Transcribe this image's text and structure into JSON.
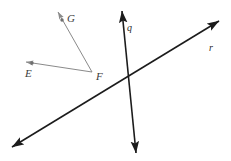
{
  "figure": {
    "type": "geometry-diagram",
    "width": 231,
    "height": 161,
    "background_color": "#ffffff",
    "points": [
      {
        "id": "E",
        "label": "E",
        "x": 32,
        "y": 63,
        "label_x": 25,
        "label_y": 68,
        "marker": "dot",
        "marker_color": "#6f6f6f"
      },
      {
        "id": "G",
        "label": "G",
        "x": 62,
        "y": 20,
        "label_x": 67,
        "label_y": 13,
        "marker": "dot",
        "marker_color": "#6f6f6f"
      },
      {
        "id": "F",
        "label": "F",
        "x": 92,
        "y": 72,
        "label_x": 96,
        "label_y": 71,
        "marker": "none",
        "marker_color": "#6f6f6f"
      }
    ],
    "rays": [
      {
        "id": "ray-FE",
        "name": "ray-FE",
        "from": "F",
        "through": "E",
        "x1": 92,
        "y1": 72,
        "x2": 24,
        "y2": 61,
        "color": "#8a8a8a",
        "stroke_width": 1,
        "arrow_at": "end"
      },
      {
        "id": "ray-FG",
        "name": "ray-FG",
        "from": "F",
        "through": "G",
        "x1": 92,
        "y1": 72,
        "x2": 56,
        "y2": 9,
        "color": "#8a8a8a",
        "stroke_width": 1,
        "arrow_at": "end"
      }
    ],
    "lines": [
      {
        "id": "line-q",
        "label": "q",
        "label_x": 127,
        "label_y": 23,
        "x1": 122,
        "y1": 11,
        "x2": 136,
        "y2": 153,
        "color": "#1c1c1c",
        "stroke_width": 1.6,
        "arrow_at": "both"
      },
      {
        "id": "line-r",
        "label": "r",
        "label_x": 209,
        "label_y": 43,
        "x1": 12,
        "y1": 147,
        "x2": 219,
        "y2": 21,
        "color": "#1c1c1c",
        "stroke_width": 1.6,
        "arrow_at": "both"
      }
    ],
    "intersections": [
      {
        "id": "q-r-intersection",
        "lines": [
          "q",
          "r"
        ],
        "x": 126,
        "y": 85,
        "marked": false
      }
    ]
  }
}
